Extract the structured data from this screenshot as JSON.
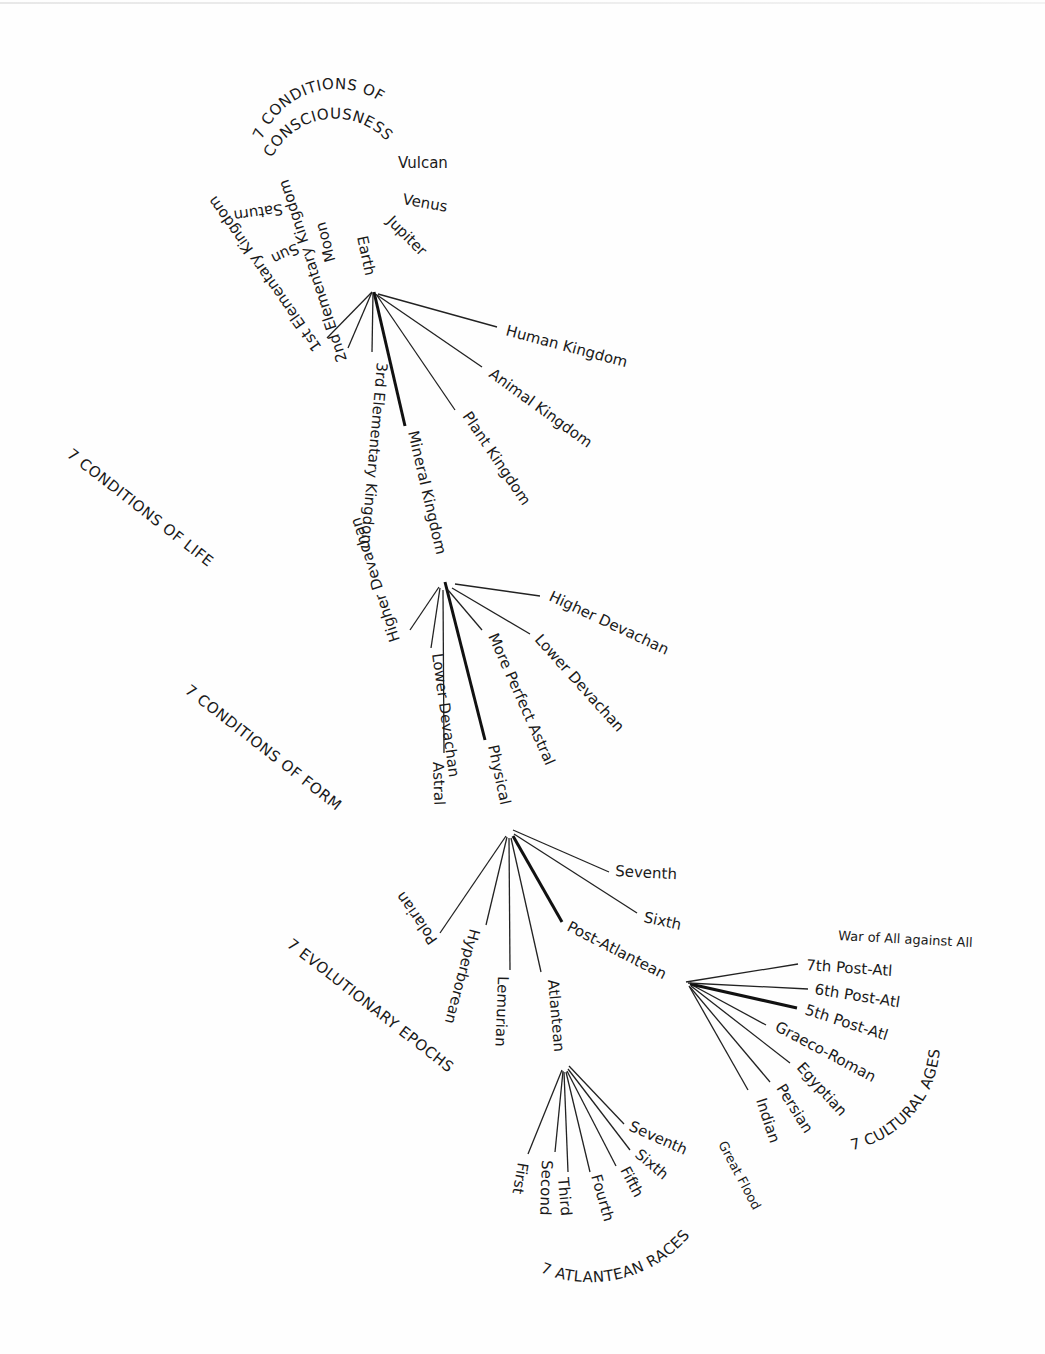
{
  "diagram": {
    "levels": [
      {
        "id": "consciousness",
        "caption": "7 CONDITIONS OF CONSCIOUSNESS",
        "caption_line1": "7 CONDITIONS OF",
        "caption_line2": "CONSCIOUSNESS",
        "items": [
          "Saturn",
          "Sun",
          "Moon",
          "Earth",
          "Jupiter",
          "Venus",
          "Vulcan"
        ],
        "highlighted": "Earth"
      },
      {
        "id": "life",
        "caption": "7 CONDITIONS OF LIFE",
        "parent": "Earth",
        "items": [
          "1st Elementary Kingdom",
          "2nd Elementary Kingdom",
          "3rd Elementary Kingdom",
          "Mineral Kingdom",
          "Plant Kingdom",
          "Animal Kingdom",
          "Human Kingdom"
        ],
        "highlighted": "Mineral Kingdom"
      },
      {
        "id": "form",
        "caption": "7 CONDITIONS OF FORM",
        "parent": "Mineral Kingdom",
        "items": [
          "Higher Devachan",
          "Lower Devachan",
          "Astral",
          "Physical",
          "More Perfect Astral",
          "Lower Devachan",
          "Higher Devachan"
        ],
        "highlighted": "Physical"
      },
      {
        "id": "epochs",
        "caption": "7 EVOLUTIONARY EPOCHS",
        "parent": "Physical",
        "items": [
          "Polarian",
          "Hyperborean",
          "Lemurian",
          "Atlantean",
          "Post-Atlantean",
          "Sixth",
          "Seventh"
        ],
        "highlighted": "Post-Atlantean"
      },
      {
        "id": "cultural_ages",
        "caption": "7 CULTURAL AGES",
        "parent": "Post-Atlantean",
        "items": [
          "Indian",
          "Persian",
          "Egyptian",
          "Graeco-Roman",
          "5th Post-Atl",
          "6th Post-Atl",
          "7th Post-Atl"
        ],
        "highlighted": "5th Post-Atl",
        "annotation_top": "War of All against All",
        "annotation_bottom": "Great Flood"
      },
      {
        "id": "atlantean_races",
        "caption": "7 ATLANTEAN RACES",
        "parent": "Atlantean",
        "items": [
          "First",
          "Second",
          "Third",
          "Fourth",
          "Fifth",
          "Sixth",
          "Seventh"
        ]
      }
    ]
  }
}
